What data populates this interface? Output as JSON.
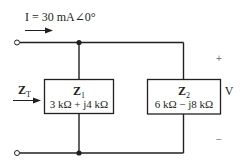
{
  "source_current": {
    "label": "I = 30 mA∠0°"
  },
  "total_impedance": {
    "symbol": "Z",
    "subscript": "T"
  },
  "z1": {
    "symbol": "Z",
    "subscript": "1",
    "value": "3 kΩ + j4 kΩ"
  },
  "z2": {
    "symbol": "Z",
    "subscript": "2",
    "value": "6 kΩ − j8 kΩ"
  },
  "voltage": {
    "label": "V",
    "plus": "+",
    "minus": "−"
  },
  "colors": {
    "wire": "#231f20",
    "box_fill": "#ffffff"
  }
}
